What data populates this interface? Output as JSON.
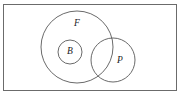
{
  "figure": {
    "type": "venn-diagram",
    "width": 182,
    "height": 97,
    "background_color": "#ffffff",
    "stroke_color": "#595959",
    "universe_stroke_color": "#6b6b6b",
    "label_color": "#1a1a1a"
  },
  "universe": {
    "name": "universal-set-rectangle",
    "x": 3.5,
    "y": 4.5,
    "width": 173,
    "height": 86,
    "label": ""
  },
  "sets": [
    {
      "id": "F",
      "label": "F",
      "cx": 77,
      "cy": 47,
      "r": 36,
      "label_x": 77,
      "label_y": 24
    },
    {
      "id": "B",
      "label": "B",
      "cx": 70,
      "cy": 52,
      "r": 12,
      "label_x": 70,
      "label_y": 52
    },
    {
      "id": "P",
      "label": "P",
      "cx": 113,
      "cy": 60,
      "r": 22,
      "label_x": 120,
      "label_y": 61
    }
  ],
  "relations": {
    "B_subset_of_F": true,
    "F_intersects_P": true,
    "B_intersects_P": false
  }
}
